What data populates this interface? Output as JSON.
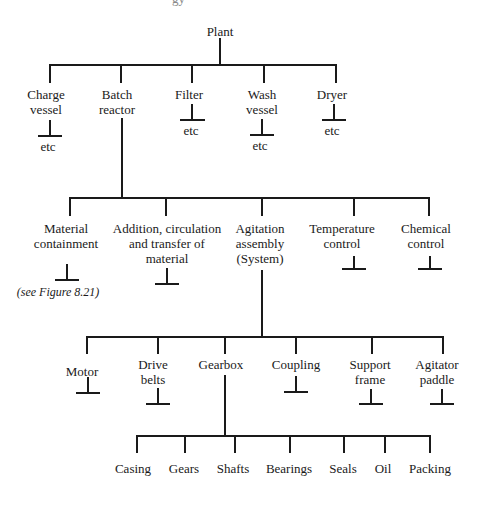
{
  "header_fragment": "gy",
  "tree": {
    "root": {
      "label": "Plant",
      "x": 220,
      "y": 24
    },
    "level1": [
      {
        "label": "Charge vessel",
        "lines": [
          "Charge",
          "vessel"
        ],
        "x": 46,
        "y": 87,
        "child": "etc"
      },
      {
        "label": "Batch reactor",
        "lines": [
          "Batch",
          "reactor"
        ],
        "x": 117,
        "y": 87,
        "expanded": true
      },
      {
        "label": "Filter",
        "lines": [
          "Filter",
          ""
        ],
        "x": 189,
        "y": 87,
        "child": "etc"
      },
      {
        "label": "Wash vessel",
        "lines": [
          "Wash",
          "vessel"
        ],
        "x": 262,
        "y": 87,
        "child": "etc"
      },
      {
        "label": "Dryer",
        "lines": [
          "Dryer",
          ""
        ],
        "x": 332,
        "y": 87,
        "child": "etc"
      }
    ],
    "level1_children_label": "etc",
    "level2": [
      {
        "label": "Material containment",
        "lines": [
          "Material",
          "containment",
          ""
        ],
        "x": 70,
        "y": 221
      },
      {
        "label": "Addition, circulation and transfer of material",
        "lines": [
          "Addition, circulation",
          "and transfer of",
          "material"
        ],
        "x": 166,
        "y": 221
      },
      {
        "label": "Agitation assembly (System)",
        "lines": [
          "Agitation",
          "assembly",
          "(System)"
        ],
        "x": 262,
        "y": 221,
        "expanded": true
      },
      {
        "label": "Temperature control",
        "lines": [
          "Temperature",
          "control",
          ""
        ],
        "x": 354,
        "y": 221
      },
      {
        "label": "Chemical control",
        "lines": [
          "Chemical",
          "control",
          ""
        ],
        "x": 429,
        "y": 221
      }
    ],
    "note": "(see Figure 8.21)",
    "level3": [
      {
        "label": "Motor",
        "lines": [
          "Motor",
          ""
        ],
        "x": 87,
        "y": 357
      },
      {
        "label": "Drive belts",
        "lines": [
          "Drive",
          "belts"
        ],
        "x": 153,
        "y": 357
      },
      {
        "label": "Gearbox",
        "lines": [
          "Gearbox",
          ""
        ],
        "x": 221,
        "y": 357,
        "expanded": true
      },
      {
        "label": "Coupling",
        "lines": [
          "Coupling",
          ""
        ],
        "x": 296,
        "y": 357
      },
      {
        "label": "Support frame",
        "lines": [
          "Support",
          "frame"
        ],
        "x": 370,
        "y": 357
      },
      {
        "label": "Agitator paddle",
        "lines": [
          "Agitator",
          "paddle"
        ],
        "x": 437,
        "y": 357
      }
    ],
    "level4": [
      {
        "label": "Casing",
        "x": 133
      },
      {
        "label": "Gears",
        "x": 184
      },
      {
        "label": "Shafts",
        "x": 233
      },
      {
        "label": "Bearings",
        "x": 289
      },
      {
        "label": "Seals",
        "x": 343
      },
      {
        "label": "Oil",
        "x": 383
      },
      {
        "label": "Packing",
        "x": 430
      }
    ]
  }
}
